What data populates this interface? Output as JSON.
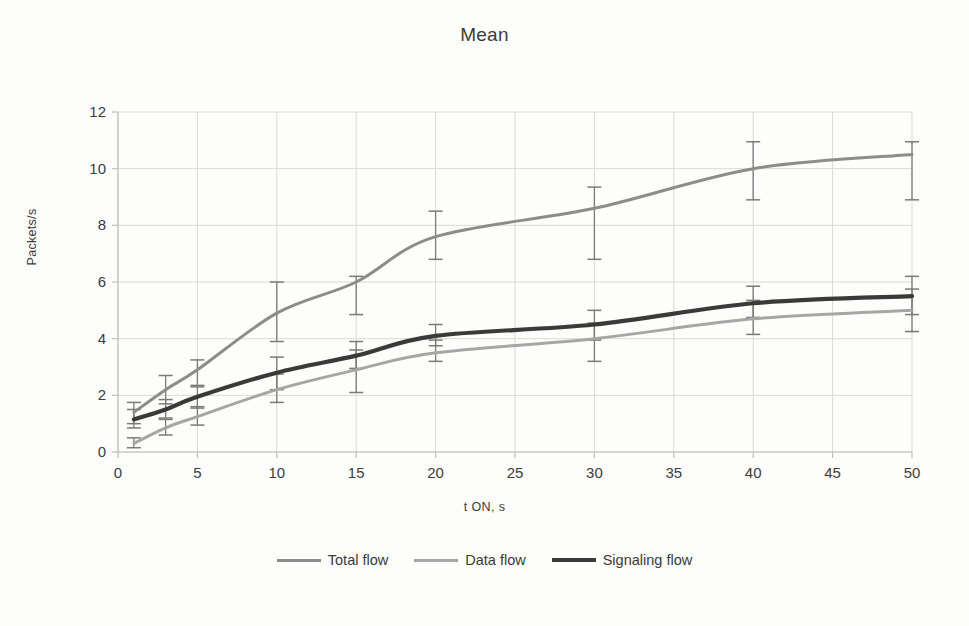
{
  "chart_data": {
    "type": "line",
    "title": "Mean",
    "xlabel": "t ON, s",
    "ylabel": "Packets/s",
    "xlim": [
      0,
      50
    ],
    "ylim": [
      0,
      12
    ],
    "xticks": [
      0,
      5,
      10,
      15,
      20,
      25,
      30,
      35,
      40,
      45,
      50
    ],
    "yticks": [
      0,
      2,
      4,
      6,
      8,
      10,
      12
    ],
    "grid": true,
    "legend_position": "bottom",
    "x": [
      1,
      3,
      5,
      10,
      15,
      20,
      30,
      40,
      50
    ],
    "series": [
      {
        "name": "Total flow",
        "color": "#8c8c8c",
        "width": 3.0,
        "values": [
          1.4,
          2.2,
          2.9,
          4.9,
          6.0,
          7.6,
          8.6,
          10.0,
          10.5
        ],
        "err_low": [
          1.0,
          1.7,
          2.3,
          3.9,
          4.85,
          6.8,
          6.8,
          8.9,
          8.9
        ],
        "err_high": [
          1.75,
          2.7,
          3.25,
          6.0,
          6.2,
          8.5,
          9.35,
          10.95,
          10.95
        ]
      },
      {
        "name": "Data flow",
        "color": "#a6a6a6",
        "width": 3.0,
        "values": [
          0.3,
          0.85,
          1.25,
          2.2,
          2.9,
          3.5,
          4.0,
          4.7,
          5.0
        ],
        "err_low": [
          0.15,
          0.6,
          0.95,
          1.75,
          2.1,
          3.2,
          3.2,
          4.15,
          4.25
        ],
        "err_high": [
          0.5,
          1.15,
          1.6,
          2.75,
          3.6,
          3.95,
          4.55,
          5.35,
          5.75
        ]
      },
      {
        "name": "Signaling flow",
        "color": "#3a3a3a",
        "width": 4.2,
        "values": [
          1.15,
          1.5,
          1.95,
          2.8,
          3.4,
          4.1,
          4.5,
          5.25,
          5.5
        ],
        "err_low": [
          0.85,
          1.2,
          1.55,
          2.2,
          2.95,
          3.75,
          3.95,
          4.75,
          4.85
        ],
        "err_high": [
          1.5,
          1.85,
          2.35,
          3.35,
          3.9,
          4.5,
          5.0,
          5.85,
          6.2
        ]
      }
    ]
  },
  "axes": {
    "xtick_labels": [
      "0",
      "5",
      "10",
      "15",
      "20",
      "25",
      "30",
      "35",
      "40",
      "45",
      "50"
    ],
    "ytick_labels": [
      "0",
      "2",
      "4",
      "6",
      "8",
      "10",
      "12"
    ]
  },
  "legend": {
    "items": [
      {
        "label": "Total flow",
        "color": "#8c8c8c"
      },
      {
        "label": "Data flow",
        "color": "#a6a6a6"
      },
      {
        "label": "Signaling flow",
        "color": "#3a3a3a"
      }
    ]
  },
  "colors": {
    "grid": "#d9d9d9",
    "axis": "#bfbfbf",
    "text": "#3c3c3c",
    "background": "#fdfdfb"
  }
}
